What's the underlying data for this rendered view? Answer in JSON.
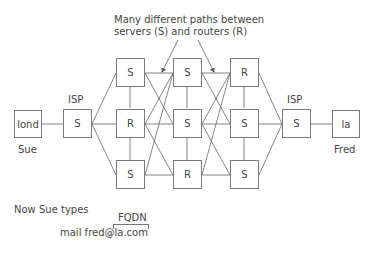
{
  "caption": {
    "line1": "Many different paths between",
    "line2": "servers (S) and routers (R)"
  },
  "endpoints": {
    "left": {
      "box_label": "lond",
      "name": "Sue"
    },
    "right": {
      "box_label": "la",
      "name": "Fred"
    }
  },
  "isp": {
    "left": {
      "label": "ISP",
      "box_label": "S"
    },
    "right": {
      "label": "ISP",
      "box_label": "S"
    }
  },
  "network": {
    "columns": [
      [
        "S",
        "R",
        "S"
      ],
      [
        "S",
        "S",
        "R"
      ],
      [
        "R",
        "S",
        "S"
      ]
    ]
  },
  "footer": {
    "now_text": "Now Sue types",
    "fqdn_label": "FQDN",
    "command": "mail fred@la.com"
  },
  "colors": {
    "line": "#666666",
    "box_border": "#7a7a7a",
    "text": "#444444"
  }
}
